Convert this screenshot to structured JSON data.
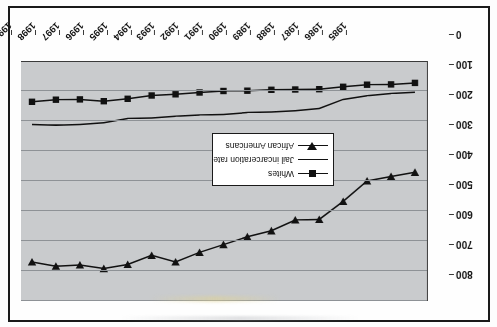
{
  "chart_data": {
    "type": "line",
    "title": "",
    "xlabel": "",
    "ylabel": "",
    "orientation_note": "chart is printed rotated 180 degrees (upside down) in the scan",
    "x": [
      1985,
      1986,
      1987,
      1988,
      1989,
      1990,
      1991,
      1992,
      1993,
      1994,
      1995,
      1996,
      1997,
      1998,
      1999,
      2000,
      2001
    ],
    "categories": [
      "1985",
      "1986",
      "1987",
      "1988",
      "1989",
      "1990",
      "1991",
      "1992",
      "1993",
      "1994",
      "1995",
      "1996",
      "1997",
      "1998",
      "1999",
      "2000",
      "2001"
    ],
    "ylim": [
      0,
      800
    ],
    "yticks": [
      0,
      100,
      200,
      300,
      400,
      500,
      600,
      700,
      800
    ],
    "grid": true,
    "legend_position": "inside-center-left",
    "series": [
      {
        "name": "African Americans",
        "marker": "triangle",
        "values": [
          371,
          385,
          400,
          468,
          528,
          530,
          566,
          586,
          612,
          638,
          670,
          648,
          678,
          692,
          680,
          684,
          670
        ]
      },
      {
        "name": "Jail incarceration rate",
        "marker": "none",
        "values": [
          104,
          108,
          116,
          128,
          158,
          166,
          170,
          172,
          178,
          180,
          184,
          190,
          192,
          206,
          212,
          214,
          212
        ]
      },
      {
        "name": "Whites",
        "marker": "square",
        "values": [
          73,
          78,
          79,
          86,
          94,
          95,
          96,
          99,
          100,
          105,
          111,
          115,
          126,
          134,
          128,
          129,
          136
        ]
      }
    ]
  },
  "legend": {
    "items": [
      {
        "label": "Whites",
        "key": "square-marker"
      },
      {
        "label": "Jail incarceration rate",
        "key": "plain-line"
      },
      {
        "label": "African Americans",
        "key": "triangle-marker"
      }
    ]
  }
}
